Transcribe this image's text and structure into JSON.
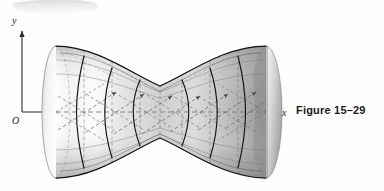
{
  "figure": {
    "caption": "Figure 15–29",
    "background_color": "#fefefe",
    "ink_color": "#1a1a1a",
    "artifact": {
      "name": "scan-smudge",
      "color": "#e9e9e9",
      "description": "light gray scanning artifact along top edge"
    },
    "axes": {
      "y_label": "y",
      "x_label": "x",
      "origin_label": "O",
      "axis_color": "#2a2a2a",
      "x_axis_y": 112,
      "y_axis_x": 22,
      "x_axis_start": 22,
      "x_axis_end": 282,
      "y_axis_top": 28,
      "y_axis_bottom": 112
    },
    "surface": {
      "name": "hyperboloid-of-one-sheet",
      "type": "quadric-surface",
      "description": "Hyperboloid of one sheet rendered as an airbrushed solid of revolution about the x-axis, with ruled generating lines drawn as dashed straight segments and solid circular cross-section curves.",
      "center_x": 160,
      "waist_half_height": 26,
      "end_half_height": 66,
      "left_end_x": 56,
      "right_end_x": 266,
      "ellipse_rx": 13,
      "shading": {
        "highlight": "#fbfbfb",
        "midtone": "#c9c9c9",
        "shadow": "#8f8f8f",
        "deep_shadow": "#6f6f6f"
      },
      "cross_sections": 6,
      "ruling_lines": 12,
      "horizontal_grid_lines": 5
    }
  }
}
